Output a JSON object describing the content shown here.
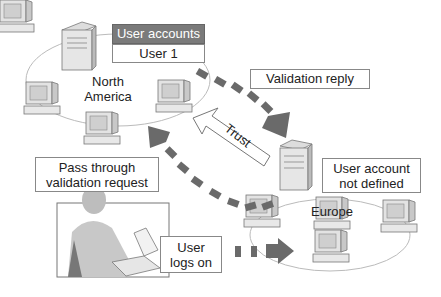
{
  "diagram": {
    "north_america": {
      "region_label": "North\nAmerica",
      "user_accounts_header": "User accounts",
      "user_accounts_row": "User 1"
    },
    "europe": {
      "region_label": "Europe",
      "note": "User account\nnot defined"
    },
    "labels": {
      "validation_reply": "Validation reply",
      "trust": "Trust",
      "pass_through": "Pass through\nvalidation request",
      "user_logs_on": "User\nlogs on"
    },
    "colors": {
      "arrow": "#6a6a6a",
      "header_fill": "#7a7a7a",
      "line": "#bbbbbb"
    }
  }
}
